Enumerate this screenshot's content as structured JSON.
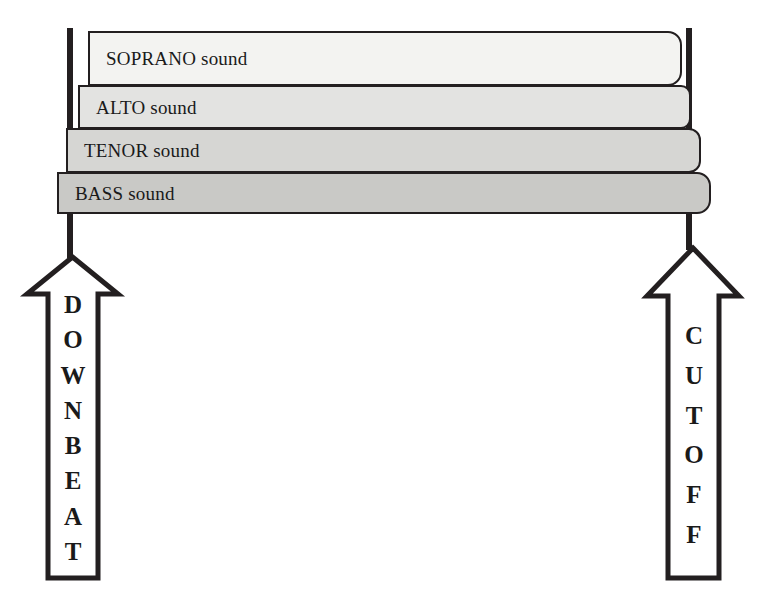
{
  "diagram": {
    "background_color": "#ffffff",
    "outline_color": "#231f20",
    "text_color": "#1a1a1a"
  },
  "voices": [
    {
      "id": "soprano",
      "label": "SOPRANO sound",
      "name": "SOPRANO",
      "suffix": "sound",
      "fill": "#f3f3f1",
      "x": 88,
      "y": 31,
      "right": 682,
      "height": 55,
      "corner_radius": 14
    },
    {
      "id": "alto",
      "label": "ALTO sound",
      "name": "ALTO",
      "suffix": "sound",
      "fill": "#e3e3e1",
      "x": 78,
      "y": 85,
      "right": 691,
      "height": 44,
      "corner_radius": 10
    },
    {
      "id": "tenor",
      "label": "TENOR sound",
      "name": "TENOR",
      "suffix": "sound",
      "fill": "#d6d6d3",
      "x": 66,
      "y": 128,
      "right": 701,
      "height": 45,
      "corner_radius": 12
    },
    {
      "id": "bass",
      "label": "BASS sound",
      "name": "BASS",
      "suffix": "sound",
      "fill": "#c9c9c6",
      "x": 57,
      "y": 172,
      "right": 711,
      "height": 42,
      "corner_radius": 14
    }
  ],
  "arrows": [
    {
      "id": "downbeat",
      "label": "DOWNBEAT",
      "letters": [
        "D",
        "O",
        "W",
        "N",
        "B",
        "E",
        "A",
        "T"
      ],
      "direction": "up",
      "fill": "#ffffff",
      "stroke": "#231f20",
      "tip_y": 257,
      "bottom_y": 578,
      "head_left": 27,
      "head_right": 118,
      "head_base_y": 294,
      "shaft_left": 48,
      "shaft_right": 98,
      "letters_top": 292,
      "letters_bottom": 562
    },
    {
      "id": "cutoff",
      "label": "CUTOFF",
      "letters": [
        "C",
        "U",
        "T",
        "O",
        "F",
        "F"
      ],
      "direction": "up",
      "fill": "#ffffff",
      "stroke": "#231f20",
      "tip_y": 248,
      "bottom_y": 578,
      "head_left": 647,
      "head_right": 739,
      "head_base_y": 296,
      "shaft_left": 668,
      "shaft_right": 719,
      "letters_top": 323,
      "letters_bottom": 545
    }
  ],
  "guide_lines": [
    {
      "id": "downbeat-line",
      "name": "downbeat-vertical-line",
      "x": 70,
      "top_y": 28,
      "bottom_y": 258,
      "width": 6,
      "color": "#231f20"
    },
    {
      "id": "cutoff-line",
      "name": "cutoff-vertical-line",
      "x": 689,
      "top_y": 28,
      "bottom_y": 250,
      "width": 6,
      "color": "#231f20"
    }
  ]
}
